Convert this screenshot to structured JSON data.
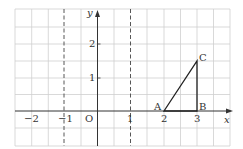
{
  "diagram": {
    "type": "coordinate-grid",
    "axes": {
      "x_label": "x",
      "y_label": "y",
      "origin_label": "O"
    },
    "x_ticks": [
      {
        "value": -2,
        "label": "−2"
      },
      {
        "value": -1,
        "label": "−1"
      },
      {
        "value": 2,
        "label": "2"
      },
      {
        "value": 3,
        "label": "3"
      }
    ],
    "x_tick_one": {
      "value": 1,
      "label": "1"
    },
    "y_ticks": [
      {
        "value": 1,
        "label": "1"
      },
      {
        "value": 2,
        "label": "2"
      }
    ],
    "dashed_lines": [
      {
        "x": -1
      },
      {
        "x": 1
      }
    ],
    "triangle": {
      "points": [
        {
          "name": "A",
          "x": 2,
          "y": 0
        },
        {
          "name": "B",
          "x": 3,
          "y": 0
        },
        {
          "name": "C",
          "x": 3,
          "y": 1.5
        }
      ]
    },
    "colors": {
      "grid": "#c8c8c8",
      "axis": "#333333",
      "shape": "#222222"
    }
  }
}
